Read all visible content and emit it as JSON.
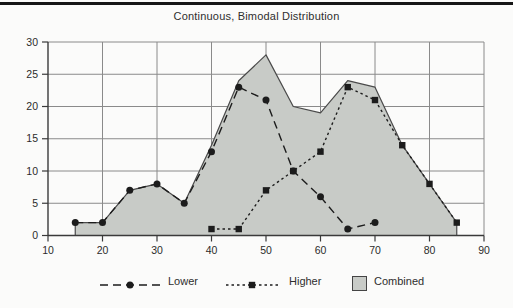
{
  "figure": {
    "title": "Continuous, Bimodal Distribution"
  },
  "chart_data": {
    "type": "area",
    "title": "Continuous, Bimodal Distribution",
    "xlabel": "",
    "ylabel": "",
    "xlim": [
      10,
      90
    ],
    "ylim": [
      0,
      30
    ],
    "xticks": [
      10,
      20,
      30,
      40,
      50,
      60,
      70,
      80,
      90
    ],
    "yticks": [
      0,
      5,
      10,
      15,
      20,
      25,
      30
    ],
    "grid": true,
    "legend_position": "bottom",
    "series": [
      {
        "name": "Lower",
        "type": "line",
        "marker": "circle",
        "linestyle": "dashed",
        "x": [
          15,
          20,
          25,
          30,
          35,
          40,
          45,
          50,
          55,
          60,
          65,
          70
        ],
        "y": [
          2,
          2,
          7,
          8,
          5,
          13,
          23,
          21,
          10,
          6,
          1,
          2
        ]
      },
      {
        "name": "Higher",
        "type": "line",
        "marker": "square",
        "linestyle": "dotted",
        "x": [
          40,
          45,
          50,
          55,
          60,
          65,
          70,
          75,
          80,
          85
        ],
        "y": [
          1,
          1,
          7,
          10,
          13,
          23,
          21,
          14,
          8,
          2
        ]
      },
      {
        "name": "Combined",
        "type": "area",
        "x": [
          15,
          20,
          25,
          30,
          35,
          40,
          45,
          50,
          55,
          60,
          65,
          70,
          75,
          80,
          85
        ],
        "y": [
          2,
          2,
          7,
          8,
          5,
          14,
          24,
          28,
          20,
          19,
          24,
          23,
          14,
          8,
          2
        ]
      }
    ],
    "legend": {
      "items": [
        {
          "label": "Lower",
          "sample": "dashed-line-circle-marker"
        },
        {
          "label": "Higher",
          "sample": "dotted-line-square-marker"
        },
        {
          "label": "Combined",
          "sample": "gray-filled-swatch"
        }
      ]
    }
  },
  "colors": {
    "background": "#fbfbfa",
    "top_rule": "#161616",
    "grid": "#8a8a8a",
    "axis": "#3a3a3a",
    "area_fill": "#c8cbc7",
    "area_stroke": "#4a4a4a",
    "series_line": "#1c1c1c",
    "text": "#2b2b2b"
  }
}
